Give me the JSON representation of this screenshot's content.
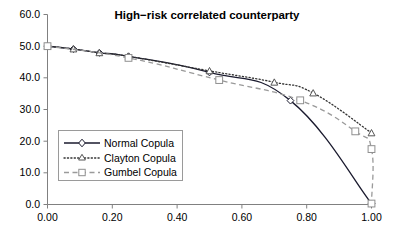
{
  "chart_data": {
    "type": "line",
    "title": "High−risk correlated counterparty",
    "xlabel": "",
    "ylabel": "",
    "xlim": [
      0.0,
      1.0
    ],
    "ylim": [
      0.0,
      60.0
    ],
    "xticks": [
      "0.00",
      "0.20",
      "0.40",
      "0.60",
      "0.80",
      "1.00"
    ],
    "xtick_values": [
      0.0,
      0.2,
      0.4,
      0.6,
      0.8,
      1.0
    ],
    "yticks": [
      "0.0",
      "10.0",
      "20.0",
      "30.0",
      "40.0",
      "50.0",
      "60.0"
    ],
    "ytick_values": [
      0,
      10,
      20,
      30,
      40,
      50,
      60
    ],
    "grid": false,
    "legend_position": "center-left",
    "series": [
      {
        "name": "Normal Copula",
        "marker": "diamond",
        "linestyle": "solid",
        "color": "#1a1a2e",
        "points": [
          {
            "x": 0.0,
            "y": 50.0
          },
          {
            "x": 0.08,
            "y": 49.1
          },
          {
            "x": 0.16,
            "y": 47.9
          },
          {
            "x": 0.25,
            "y": 46.8
          },
          {
            "x": 0.5,
            "y": 41.7
          },
          {
            "x": 0.75,
            "y": 32.8
          },
          {
            "x": 1.0,
            "y": 0.3
          }
        ]
      },
      {
        "name": "Clayton Copula",
        "marker": "triangle",
        "linestyle": "dotted",
        "color": "#333333",
        "points": [
          {
            "x": 0.0,
            "y": 50.0
          },
          {
            "x": 0.08,
            "y": 49.1
          },
          {
            "x": 0.16,
            "y": 47.9
          },
          {
            "x": 0.25,
            "y": 46.8
          },
          {
            "x": 0.5,
            "y": 42.2
          },
          {
            "x": 0.7,
            "y": 38.6
          },
          {
            "x": 0.82,
            "y": 35.2
          },
          {
            "x": 1.0,
            "y": 22.6
          }
        ]
      },
      {
        "name": "Gumbel Copula",
        "marker": "square",
        "linestyle": "dashed",
        "color": "#9a9a9a",
        "points": [
          {
            "x": 0.0,
            "y": 50.0
          },
          {
            "x": 0.25,
            "y": 46.3
          },
          {
            "x": 0.53,
            "y": 39.3
          },
          {
            "x": 0.78,
            "y": 32.9
          },
          {
            "x": 0.95,
            "y": 23.1
          },
          {
            "x": 1.0,
            "y": 17.5
          },
          {
            "x": 1.0,
            "y": 0.3
          }
        ]
      }
    ]
  },
  "legend": {
    "entries": [
      {
        "label": "Normal Copula",
        "key": "normal"
      },
      {
        "label": "Clayton Copula",
        "key": "clayton"
      },
      {
        "label": "Gumbel Copula",
        "key": "gumbel"
      }
    ]
  },
  "colors": {
    "normal": "#1a1a2e",
    "clayton": "#333333",
    "gumbel": "#9a9a9a",
    "axis": "#808080",
    "background": "#ffffff"
  }
}
